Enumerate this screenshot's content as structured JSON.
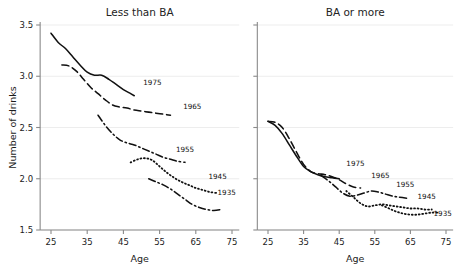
{
  "figure": {
    "background": "#ffffff",
    "ink": "#111111",
    "grid_color": "#e9e9e9"
  },
  "chart_data": [
    {
      "type": "line",
      "title": "Less than BA",
      "xlabel": "Age",
      "ylabel": "Number of drinks",
      "xlim": [
        22,
        77
      ],
      "ylim": [
        1.45,
        3.62
      ],
      "xticks": [
        25,
        35,
        45,
        55,
        65,
        75
      ],
      "yticks": [
        1.5,
        2.0,
        2.5,
        3.0,
        3.5
      ],
      "grid": true,
      "legend_position": "inline-right-of-line-end",
      "series": [
        {
          "name": "1975",
          "style": "solid",
          "label": "1975",
          "label_x": 50.5,
          "label_y": 2.91,
          "x": [
            25,
            27,
            29,
            31,
            33,
            35,
            37,
            39,
            41,
            43,
            45,
            47,
            48
          ],
          "y": [
            3.42,
            3.33,
            3.27,
            3.19,
            3.11,
            3.04,
            3.01,
            3.01,
            2.97,
            2.92,
            2.87,
            2.83,
            2.81
          ]
        },
        {
          "name": "1965",
          "style": "dashed",
          "label": "1965",
          "label_x": 61.5,
          "label_y": 2.68,
          "x": [
            28,
            30,
            32,
            34,
            36,
            38,
            40,
            42,
            44,
            46,
            48,
            50,
            52,
            54,
            56,
            58
          ],
          "y": [
            3.11,
            3.1,
            3.05,
            2.97,
            2.89,
            2.83,
            2.77,
            2.72,
            2.7,
            2.69,
            2.67,
            2.66,
            2.65,
            2.64,
            2.63,
            2.62
          ]
        },
        {
          "name": "1955",
          "style": "dashdot",
          "label": "1955",
          "label_x": 59.5,
          "label_y": 2.26,
          "x": [
            38,
            40,
            42,
            44,
            46,
            48,
            50,
            52,
            54,
            56,
            58,
            60,
            62
          ],
          "y": [
            2.62,
            2.52,
            2.44,
            2.38,
            2.35,
            2.33,
            2.3,
            2.27,
            2.24,
            2.21,
            2.19,
            2.17,
            2.16
          ]
        },
        {
          "name": "1945",
          "style": "dotted",
          "label": "1945",
          "label_x": 68.5,
          "label_y": 2.0,
          "x": [
            47,
            49,
            51,
            53,
            55,
            57,
            59,
            61,
            63,
            65,
            67,
            69,
            71
          ],
          "y": [
            2.16,
            2.19,
            2.2,
            2.18,
            2.12,
            2.06,
            2.01,
            1.97,
            1.94,
            1.91,
            1.89,
            1.87,
            1.86
          ]
        },
        {
          "name": "1935",
          "style": "dashdot",
          "label": "1935",
          "label_x": 71.0,
          "label_y": 1.84,
          "x": [
            52,
            54,
            56,
            58,
            60,
            62,
            64,
            66,
            68,
            70,
            72
          ],
          "y": [
            2.0,
            1.97,
            1.94,
            1.9,
            1.85,
            1.8,
            1.75,
            1.72,
            1.7,
            1.69,
            1.7
          ]
        }
      ]
    },
    {
      "type": "line",
      "title": "BA or more",
      "xlabel": "Age",
      "ylabel": "",
      "xlim": [
        22,
        77
      ],
      "ylim": [
        1.45,
        3.62
      ],
      "xticks": [
        25,
        35,
        45,
        55,
        65,
        75
      ],
      "yticks": [
        1.5,
        2.0,
        2.5,
        3.0,
        3.5
      ],
      "grid": true,
      "legend_position": "inline-right-of-line-end",
      "series": [
        {
          "name": "1975",
          "style": "solid",
          "label": "1975",
          "label_x": 47.0,
          "label_y": 2.12,
          "x": [
            25,
            27,
            29,
            31,
            33,
            35,
            37,
            39,
            41,
            43,
            45
          ],
          "y": [
            2.56,
            2.52,
            2.44,
            2.33,
            2.22,
            2.12,
            2.07,
            2.04,
            2.02,
            2.01,
            2.0
          ]
        },
        {
          "name": "1965",
          "style": "dashed",
          "label": "1965",
          "label_x": 54.0,
          "label_y": 2.01,
          "x": [
            25,
            27,
            29,
            31,
            33,
            35,
            37,
            39,
            41,
            43,
            45,
            47,
            49,
            51
          ],
          "y": [
            2.56,
            2.55,
            2.5,
            2.39,
            2.26,
            2.14,
            2.07,
            2.05,
            2.04,
            2.02,
            1.99,
            1.95,
            1.92,
            1.91
          ]
        },
        {
          "name": "1955",
          "style": "dashdot",
          "label": "1955",
          "label_x": 61.0,
          "label_y": 1.92,
          "x": [
            40,
            42,
            44,
            46,
            48,
            50,
            52,
            54,
            56,
            58,
            60,
            62,
            64
          ],
          "y": [
            2.03,
            1.98,
            1.92,
            1.86,
            1.83,
            1.84,
            1.86,
            1.88,
            1.87,
            1.85,
            1.83,
            1.82,
            1.81
          ]
        },
        {
          "name": "1945",
          "style": "dotted",
          "label": "1945",
          "label_x": 67.0,
          "label_y": 1.8,
          "x": [
            47,
            49,
            51,
            53,
            55,
            57,
            59,
            61,
            63,
            65,
            67,
            69,
            71
          ],
          "y": [
            1.88,
            1.82,
            1.76,
            1.73,
            1.74,
            1.75,
            1.74,
            1.73,
            1.72,
            1.71,
            1.71,
            1.7,
            1.7
          ]
        },
        {
          "name": "1935",
          "style": "dotted",
          "label": "1935",
          "label_x": 71.5,
          "label_y": 1.64,
          "x": [
            57,
            59,
            61,
            63,
            65,
            67,
            69,
            71,
            73
          ],
          "y": [
            1.74,
            1.71,
            1.68,
            1.66,
            1.65,
            1.65,
            1.66,
            1.67,
            1.67
          ]
        }
      ]
    }
  ]
}
